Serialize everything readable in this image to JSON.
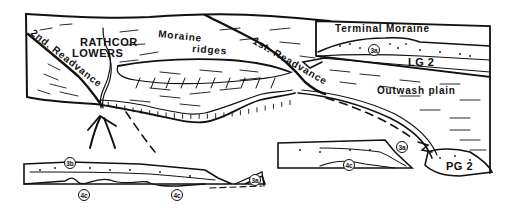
{
  "figure": {
    "type": "glacial geomorphology block diagram",
    "main_block": {
      "labels": {
        "place": [
          "RATHCOR",
          "LOWERS"
        ],
        "moraine_ridges": [
          "Moraine",
          "ridges"
        ],
        "second_readvance": "2nd. Readvance",
        "first_readvance": "1st. Readvance",
        "outwash_plain": "Outwash plain"
      }
    },
    "inset_terminal_moraine": {
      "title": "Terminal Moraine",
      "unit_label": "LG 2",
      "circled_unit": "3a"
    },
    "section_left": {
      "circled_units": [
        "3b",
        "4c",
        "4c",
        "3a"
      ]
    },
    "section_right": {
      "circled_units": [
        "4c",
        "3a"
      ],
      "unit_label": "PG 2"
    }
  }
}
